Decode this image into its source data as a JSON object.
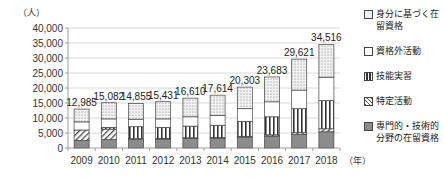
{
  "chart_data": {
    "type": "bar",
    "stacked": true,
    "title": "",
    "ylabel": "（人）",
    "xlabel": "（年）",
    "ylim": [
      0,
      40000
    ],
    "yticks": [
      0,
      5000,
      10000,
      15000,
      20000,
      25000,
      30000,
      35000,
      40000
    ],
    "ytick_labels": [
      "0",
      "5,000",
      "10,000",
      "15,000",
      "20,000",
      "25,000",
      "30,000",
      "35,000",
      "40,000"
    ],
    "grid": true,
    "legend_position": "right",
    "categories": [
      "2009",
      "2010",
      "2011",
      "2012",
      "2013",
      "2014",
      "2015",
      "2016",
      "2017",
      "2018"
    ],
    "totals": [
      12985,
      15082,
      14855,
      15431,
      16610,
      17614,
      20303,
      23683,
      29621,
      34516
    ],
    "total_labels": [
      "12,985",
      "15,082",
      "14,855",
      "15,431",
      "16,610",
      "17,614",
      "20,303",
      "23,683",
      "29,621",
      "34,516"
    ],
    "series": [
      {
        "name": "専門的・技術的分野の在留資格",
        "pattern": "solid-gray",
        "color": "#8c8c8c",
        "values": [
          2500,
          2800,
          2800,
          3000,
          3200,
          3300,
          3600,
          4000,
          4600,
          5400
        ]
      },
      {
        "name": "特定活動",
        "pattern": "diagonal",
        "color": "#ffffff",
        "values": [
          3500,
          3500,
          300,
          200,
          200,
          200,
          300,
          400,
          500,
          1000
        ]
      },
      {
        "name": "技能実習",
        "pattern": "vertical",
        "color": "#ffffff",
        "values": [
          0,
          600,
          4000,
          3700,
          3900,
          4100,
          5000,
          6000,
          8000,
          9400
        ]
      },
      {
        "name": "資格外活動",
        "pattern": "white",
        "color": "#ffffff",
        "values": [
          2700,
          2800,
          2500,
          2800,
          3100,
          3300,
          4200,
          5000,
          6200,
          7800
        ]
      },
      {
        "name": "身分に基づく在留資格",
        "pattern": "dots",
        "color": "#e6e6e6",
        "values": [
          4285,
          5382,
          5255,
          5731,
          6210,
          6714,
          7203,
          8283,
          10321,
          10916
        ]
      }
    ]
  },
  "legend": {
    "items": [
      {
        "label": "身分に基づく在留資格",
        "pattern": "dots"
      },
      {
        "label": "資格外活動",
        "pattern": "white"
      },
      {
        "label": "技能実習",
        "pattern": "vertical"
      },
      {
        "label": "特定活動",
        "pattern": "diagonal"
      },
      {
        "label": "専門的・技術的分野の在留資格",
        "pattern": "solid-gray"
      }
    ]
  }
}
